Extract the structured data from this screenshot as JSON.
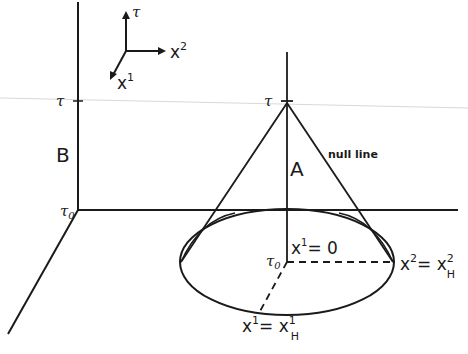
{
  "figure": {
    "axes_legend": {
      "tau": "τ",
      "x2": "x",
      "x2_sup": "2",
      "x1": "x",
      "x1_sup": "1"
    },
    "left_axis": {
      "tau_label": "τ",
      "tau0_label": "τ",
      "tau0_sub": "0",
      "region_label": "B"
    },
    "cone": {
      "apex_label": "τ",
      "region_label": "A",
      "null_line_label": "null line",
      "center_label": "τ",
      "center_sub": "0",
      "axis_label": "x",
      "axis_sup": "1",
      "axis_eq": "= 0",
      "horizon_x2_label": "x",
      "horizon_x2_sup": "2",
      "horizon_x2_eq": "= x",
      "horizon_x2_rhs_sup": "2",
      "horizon_x2_rhs_sub": "H",
      "horizon_x1_label": "x",
      "horizon_x1_sup": "1",
      "horizon_x1_eq": "= x",
      "horizon_x1_rhs_sup": "1",
      "horizon_x1_rhs_sub": "H"
    },
    "colors": {
      "ink": "#1a1a1a",
      "faint_line": "#d8d8d8"
    }
  }
}
